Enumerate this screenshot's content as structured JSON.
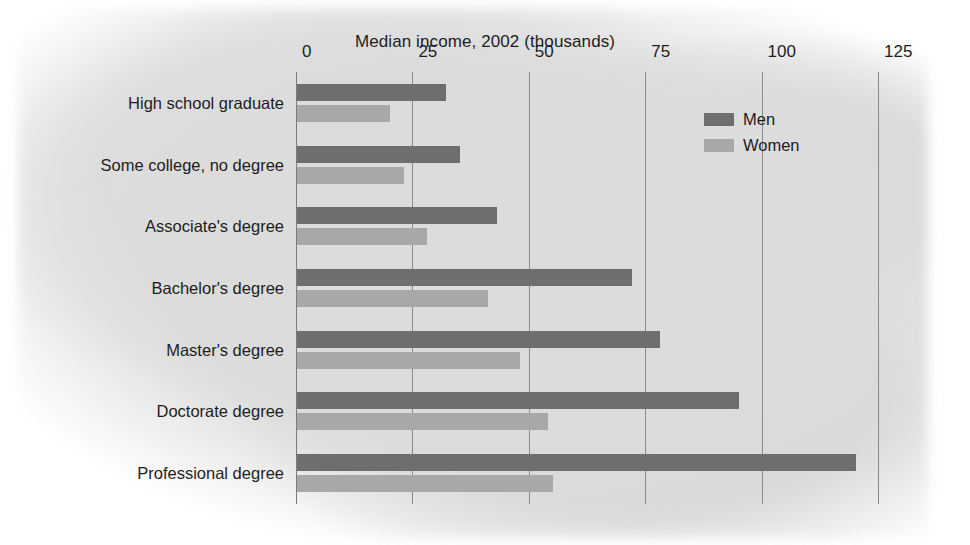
{
  "chart_data": {
    "type": "bar",
    "orientation": "horizontal",
    "title": "Median income, 2002 (thousands)",
    "xlabel": "",
    "ylabel": "",
    "xlim": [
      0,
      125
    ],
    "xticks": [
      0,
      25,
      50,
      75,
      100,
      125
    ],
    "xtick_labels": [
      "0",
      "25",
      "50",
      "75",
      "100",
      "125"
    ],
    "grid": true,
    "legend_position": "top-right",
    "categories": [
      "High school graduate",
      "Some college, no degree",
      "Associate's degree",
      "Bachelor's degree",
      "Master's degree",
      "Doctorate degree",
      "Professional degree"
    ],
    "series": [
      {
        "name": "Men",
        "color": "#6e6e6e",
        "values": [
          32,
          35,
          43,
          72,
          78,
          95,
          120
        ]
      },
      {
        "name": "Women",
        "color": "#a8a8a8",
        "values": [
          20,
          23,
          28,
          41,
          48,
          54,
          55
        ]
      }
    ]
  },
  "legend": {
    "items": [
      {
        "label": "Men",
        "swatch": "men-swatch"
      },
      {
        "label": "Women",
        "swatch": "women-swatch"
      }
    ]
  },
  "colors": {
    "men": "#6e6e6e",
    "women": "#a8a8a8",
    "grid": "#8a8a8a",
    "text": "#1d1d1d",
    "background": "#dcdcdc"
  }
}
